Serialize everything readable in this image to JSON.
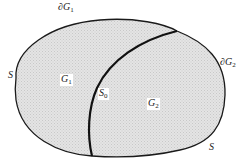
{
  "diagram": {
    "type": "domain-decomposition",
    "colors": {
      "fill": "#dedede",
      "stroke": "#1a1a1a",
      "background": "#ffffff"
    },
    "regions": [
      {
        "id": "G1",
        "label": {
          "base": "G",
          "sub": "1"
        }
      },
      {
        "id": "G2",
        "label": {
          "base": "G",
          "sub": "2"
        }
      }
    ],
    "boundaries": {
      "dG1": {
        "base": "∂G",
        "sub": "1"
      },
      "dG2": {
        "base": "∂G",
        "sub": "2"
      },
      "S_left": {
        "base": "S"
      },
      "S_right": {
        "base": "S"
      },
      "S0": {
        "base": "S",
        "sub": "0"
      }
    }
  }
}
